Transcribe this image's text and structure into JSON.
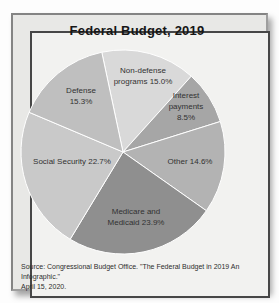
{
  "chart_data": {
    "type": "pie",
    "title": "Federal Budget, 2019",
    "start_angle_deg": -12,
    "direction": "clockwise",
    "legend": "none",
    "values_format": "percent",
    "slices": [
      {
        "id": "non-defense-programs",
        "name": "Non-defense programs",
        "value": 15.0,
        "color": "#d9d9d9",
        "label": "Non-defense\nprograms 15.0%"
      },
      {
        "id": "interest-payments",
        "name": "Interest payments",
        "value": 8.5,
        "color": "#a6a6a6",
        "label": "Interest\npayments\n8.5%"
      },
      {
        "id": "other",
        "name": "Other",
        "value": 14.6,
        "color": "#b3b3b3",
        "label": "Other 14.6%"
      },
      {
        "id": "medicare-and-medicaid",
        "name": "Medicare and Medicaid",
        "value": 23.9,
        "color": "#8f8f8f",
        "label": "Medicare and\nMedicaid 23.9%"
      },
      {
        "id": "social-security",
        "name": "Social Security",
        "value": 22.7,
        "color": "#c9c9c9",
        "label": "Social Security 22.7%"
      },
      {
        "id": "defense",
        "name": "Defense",
        "value": 15.3,
        "color": "#bfbfbf",
        "label": "Defense\n15.3%"
      }
    ]
  },
  "footer": {
    "source": "Source: Congressional Budget Office. \"The Federal Budget in 2019 An Infographic.\"\nApril 15, 2020."
  }
}
